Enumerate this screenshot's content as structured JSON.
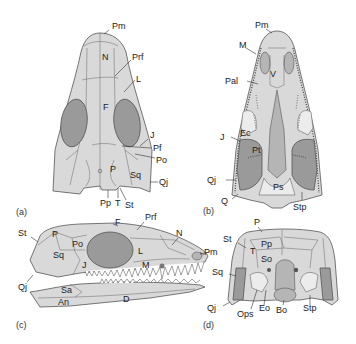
{
  "figure": {
    "panels": [
      {
        "id": "a",
        "label": "(a)",
        "view": "dorsal",
        "bone_labels": [
          "Pm",
          "N",
          "Prf",
          "L",
          "F",
          "J",
          "Pf",
          "Po",
          "P",
          "Sq",
          "Qj",
          "Pp",
          "T",
          "St"
        ]
      },
      {
        "id": "b",
        "label": "(b)",
        "view": "ventral (palatal)",
        "bone_labels": [
          "Pm",
          "M",
          "V",
          "Pal",
          "J",
          "Ec",
          "Pt",
          "Qj",
          "Q",
          "Ps",
          "Stp"
        ]
      },
      {
        "id": "c",
        "label": "(c)",
        "view": "lateral",
        "bone_labels": [
          "F",
          "Prf",
          "N",
          "St",
          "P",
          "Po",
          "Sq",
          "J",
          "L",
          "M",
          "Pm",
          "Qj",
          "Sa",
          "An",
          "D"
        ]
      },
      {
        "id": "d",
        "label": "(d)",
        "view": "occipital",
        "bone_labels": [
          "P",
          "St",
          "Pp",
          "T",
          "So",
          "Sq",
          "Qj",
          "Ops",
          "Eo",
          "Bo",
          "Stp"
        ]
      }
    ],
    "colors": {
      "bone": "#d9d9d9",
      "orbit": "#9a9a9a",
      "outline": "#555555",
      "text": "#222222"
    }
  },
  "a": {
    "label": "(a)",
    "Pm": "Pm",
    "N": "N",
    "Prf": "Prf",
    "L": "L",
    "F": "F",
    "J": "J",
    "Pf": "Pf",
    "Po": "Po",
    "P": "P",
    "Sq": "Sq",
    "Qj": "Qj",
    "Pp": "Pp",
    "T": "T",
    "St": "St"
  },
  "b": {
    "label": "(b)",
    "Pm": "Pm",
    "M": "M",
    "V": "V",
    "Pal": "Pal",
    "J": "J",
    "Ec": "Ec",
    "Pt": "Pt",
    "Qj": "Qj",
    "Q": "Q",
    "Ps": "Ps",
    "Stp": "Stp"
  },
  "c": {
    "label": "(c)",
    "F": "F",
    "Prf": "Prf",
    "N": "N",
    "St": "St",
    "P": "P",
    "Po": "Po",
    "Sq": "Sq",
    "J": "J",
    "L": "L",
    "M": "M",
    "Pm": "Pm",
    "Qj": "Qj",
    "Sa": "Sa",
    "An": "An",
    "D": "D"
  },
  "d": {
    "label": "(d)",
    "P": "P",
    "St": "St",
    "Pp": "Pp",
    "T": "T",
    "So": "So",
    "Sq": "Sq",
    "Qj": "Qj",
    "Ops": "Ops",
    "Eo": "Eo",
    "Bo": "Bo",
    "Stp": "Stp"
  }
}
